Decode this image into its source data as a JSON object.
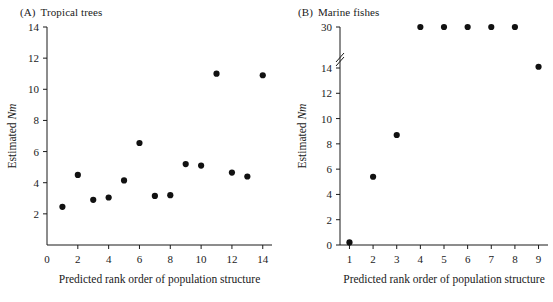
{
  "figure": {
    "background": "#ffffff",
    "ink_color": "#1a1a1a",
    "dot_color": "#111111"
  },
  "chart_data": [
    {
      "type": "scatter",
      "panel_tag": "(A)",
      "title": "Tropical trees",
      "xlabel": "Predicted rank order of population structure",
      "ylabel": "Estimated Nm",
      "ylabel_plain": "Estimated",
      "ylabel_italic": "Nm",
      "xlim": [
        0,
        14.6
      ],
      "ylim": [
        0,
        14
      ],
      "xticks": [
        0,
        2,
        4,
        6,
        8,
        10,
        12,
        14
      ],
      "xticklabels": [
        "0",
        "2",
        "4",
        "6",
        "8",
        "10",
        "12",
        "14"
      ],
      "yticks": [
        2,
        4,
        6,
        8,
        10,
        12,
        14
      ],
      "yticklabels": [
        "2",
        "4",
        "6",
        "8",
        "10",
        "12",
        "14"
      ],
      "grid": false,
      "legend": false,
      "axis_break": false,
      "x": [
        1,
        2,
        3,
        4,
        5,
        6,
        7,
        8,
        9,
        10,
        11,
        12,
        13,
        14
      ],
      "values": [
        2.45,
        4.5,
        2.9,
        3.05,
        4.15,
        6.55,
        3.15,
        3.2,
        5.2,
        5.1,
        11.0,
        4.65,
        4.4,
        10.9
      ]
    },
    {
      "type": "scatter",
      "panel_tag": "(B)",
      "title": "Marine fishes",
      "xlabel": "Predicted rank order of population structure",
      "ylabel": "Estimated Nm",
      "ylabel_plain": "Estimated",
      "ylabel_italic": "Nm",
      "xlim": [
        0.6,
        9.4
      ],
      "ylim": [
        0,
        30
      ],
      "xticks": [
        1,
        2,
        3,
        4,
        5,
        6,
        7,
        8,
        9
      ],
      "xticklabels": [
        "1",
        "2",
        "3",
        "4",
        "5",
        "6",
        "7",
        "8",
        "9"
      ],
      "yticks": [
        0,
        2,
        4,
        6,
        8,
        10,
        12,
        14,
        30
      ],
      "yticklabels": [
        "0",
        "2",
        "4",
        "6",
        "8",
        "10",
        "12",
        "14",
        "30"
      ],
      "grid": false,
      "legend": false,
      "axis_break": true,
      "axis_break_between": [
        14,
        30
      ],
      "x": [
        1,
        2,
        3,
        4,
        5,
        6,
        7,
        8,
        9
      ],
      "values": [
        0.2,
        5.4,
        8.7,
        30,
        30,
        30,
        30,
        30,
        14.1
      ]
    }
  ]
}
